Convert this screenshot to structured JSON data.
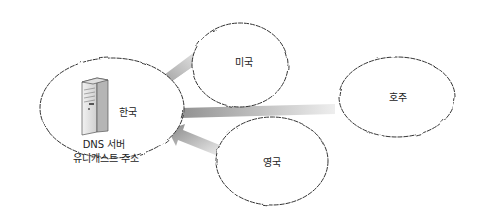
{
  "diagram": {
    "nodes": [
      {
        "id": "korea",
        "label": "한국",
        "sublabel_1": "DNS 서버",
        "sublabel_2": "유니캐스트 주소"
      },
      {
        "id": "usa",
        "label": "미국"
      },
      {
        "id": "australia",
        "label": "호주"
      },
      {
        "id": "uk",
        "label": "영국"
      }
    ],
    "edges": [
      {
        "from": "usa",
        "to": "korea"
      },
      {
        "from": "australia",
        "to": "korea"
      },
      {
        "from": "uk",
        "to": "korea"
      }
    ],
    "colors": {
      "cloud_stroke": "#333333",
      "arrow_dark": "#8a8a8a",
      "arrow_light": "#e6e6e6",
      "server": "#d9d9d9"
    }
  }
}
